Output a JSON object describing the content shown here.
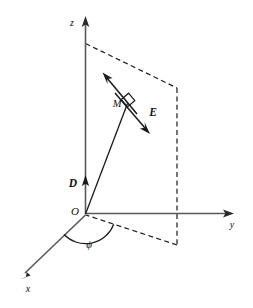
{
  "figure": {
    "background_color": "#ffffff",
    "axis_color": "#595959",
    "line_color": "#1a1a1a",
    "labels": {
      "z_axis": "z",
      "y_axis": "y",
      "x_axis": "x",
      "origin": "O",
      "vector_d": "D",
      "vector_e": "E",
      "point_m": "M",
      "angle_phi": "ϕ"
    },
    "geometry": {
      "origin": {
        "x": 85,
        "y": 214
      },
      "z_axis_tip": {
        "x": 85,
        "y": 18
      },
      "y_axis_tip": {
        "x": 233,
        "y": 213
      },
      "x_axis_tip": {
        "x": 20,
        "y": 278
      },
      "d_arrow_tip": {
        "x": 85,
        "y": 177
      },
      "m_arrow_tip": {
        "x": 103,
        "y": 73
      },
      "m_foot": {
        "x": 133,
        "y": 112
      },
      "e_arrow_tip": {
        "x": 149,
        "y": 133
      },
      "e_start": {
        "x": 115,
        "y": 93
      },
      "plane_top_left": {
        "x": 85,
        "y": 43
      },
      "plane_top_right": {
        "x": 177,
        "y": 88
      },
      "plane_bottom_right": {
        "x": 177,
        "y": 245
      },
      "phi_arc_radius": 30
    }
  }
}
